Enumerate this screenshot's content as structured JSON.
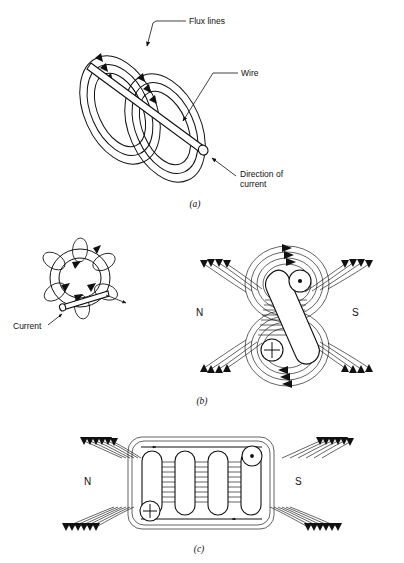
{
  "figure": {
    "background": "#ffffff",
    "ink_color": "#111111",
    "width": 404,
    "height": 563
  },
  "panels": [
    {
      "id": "a",
      "caption": "(a)",
      "subject": "straight wire with concentric flux rings",
      "labels": [
        {
          "name": "flux-lines",
          "text": "Flux lines"
        },
        {
          "name": "wire",
          "text": "Wire"
        },
        {
          "name": "direction-of-current",
          "text": "Direction of",
          "text2": "current"
        }
      ],
      "ring_groups": 2,
      "rings_per_group": 3
    },
    {
      "id": "b",
      "caption": "(b)",
      "subject": "single loop of wire and its resulting field",
      "labels": [
        {
          "name": "current",
          "text": "Current"
        },
        {
          "name": "north-pole",
          "text": "N"
        },
        {
          "name": "south-pole",
          "text": "S"
        }
      ],
      "current_out_symbol": "dot",
      "current_in_symbol": "cross",
      "flux_rings_on_loop": 6
    },
    {
      "id": "c",
      "caption": "(c)",
      "subject": "multi-turn coil (solenoid) field",
      "labels": [
        {
          "name": "north-pole",
          "text": "N"
        },
        {
          "name": "south-pole",
          "text": "S"
        }
      ],
      "turns": 4,
      "current_out_symbol": "dot",
      "current_in_symbol": "cross"
    }
  ]
}
